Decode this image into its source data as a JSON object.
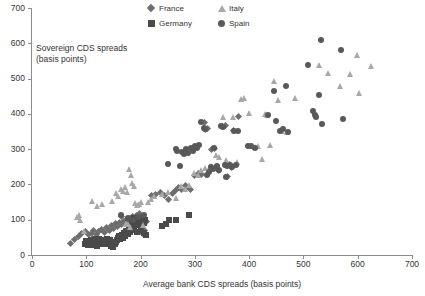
{
  "chart_data": {
    "type": "scatter",
    "title": "",
    "xlabel": "Average bank CDS spreads (basis points)",
    "ylabel": "Sovereign CDS spreads\n(basis points)",
    "annotation": "Sovereign CDS spreads\n(basis points)",
    "xlim": [
      0,
      700
    ],
    "ylim": [
      0,
      700
    ],
    "xticks": [
      0,
      100,
      200,
      300,
      400,
      500,
      600,
      700
    ],
    "yticks": [
      0,
      100,
      200,
      300,
      400,
      500,
      600,
      700
    ],
    "grid": false,
    "legend_position": "top-center",
    "series": [
      {
        "name": "France",
        "marker": "diamond",
        "color": "#6e6e6e",
        "points": [
          [
            70,
            34
          ],
          [
            78,
            45
          ],
          [
            86,
            52
          ],
          [
            92,
            60
          ],
          [
            99,
            66
          ],
          [
            104,
            57
          ],
          [
            110,
            62
          ],
          [
            113,
            70
          ],
          [
            118,
            58
          ],
          [
            122,
            66
          ],
          [
            128,
            72
          ],
          [
            133,
            63
          ],
          [
            137,
            78
          ],
          [
            142,
            70
          ],
          [
            146,
            84
          ],
          [
            150,
            76
          ],
          [
            154,
            88
          ],
          [
            158,
            80
          ],
          [
            161,
            92
          ],
          [
            165,
            86
          ],
          [
            168,
            95
          ],
          [
            171,
            88
          ],
          [
            174,
            100
          ],
          [
            177,
            93
          ],
          [
            180,
            104
          ],
          [
            183,
            97
          ],
          [
            186,
            108
          ],
          [
            189,
            99
          ],
          [
            192,
            112
          ],
          [
            195,
            104
          ],
          [
            198,
            118
          ],
          [
            201,
            109
          ],
          [
            204,
            60
          ],
          [
            207,
            70
          ],
          [
            164,
            110
          ],
          [
            176,
            86
          ],
          [
            188,
            80
          ],
          [
            196,
            66
          ],
          [
            206,
            100
          ],
          [
            210,
            95
          ],
          [
            220,
            168
          ],
          [
            228,
            172
          ],
          [
            236,
            178
          ],
          [
            244,
            168
          ],
          [
            252,
            156
          ],
          [
            258,
            175
          ],
          [
            264,
            182
          ],
          [
            270,
            190
          ],
          [
            276,
            186
          ],
          [
            282,
            196
          ],
          [
            288,
            192
          ],
          [
            292,
            185
          ],
          [
            300,
            225
          ],
          [
            306,
            232
          ],
          [
            312,
            228
          ],
          [
            318,
            375
          ],
          [
            320,
            355
          ],
          [
            324,
            358
          ],
          [
            330,
            300
          ],
          [
            336,
            302
          ],
          [
            340,
            252
          ],
          [
            344,
            240
          ],
          [
            350,
            365
          ],
          [
            356,
            366
          ],
          [
            360,
            222
          ],
          [
            364,
            256
          ],
          [
            368,
            248
          ],
          [
            372,
            352
          ],
          [
            376,
            256
          ],
          [
            380,
            392
          ]
        ]
      },
      {
        "name": "Germany",
        "marker": "square",
        "color": "#4a4a4a",
        "points": [
          [
            98,
            30
          ],
          [
            102,
            34
          ],
          [
            106,
            32
          ],
          [
            110,
            36
          ],
          [
            114,
            30
          ],
          [
            118,
            38
          ],
          [
            122,
            34
          ],
          [
            126,
            40
          ],
          [
            100,
            40
          ],
          [
            104,
            28
          ],
          [
            108,
            42
          ],
          [
            112,
            28
          ],
          [
            116,
            44
          ],
          [
            120,
            26
          ],
          [
            124,
            46
          ],
          [
            128,
            30
          ],
          [
            130,
            36
          ],
          [
            132,
            42
          ],
          [
            134,
            32
          ],
          [
            136,
            38
          ],
          [
            138,
            44
          ],
          [
            140,
            30
          ],
          [
            142,
            36
          ],
          [
            144,
            42
          ],
          [
            146,
            26
          ],
          [
            148,
            32
          ],
          [
            150,
            24
          ],
          [
            152,
            30
          ],
          [
            154,
            36
          ],
          [
            156,
            42
          ],
          [
            158,
            48
          ],
          [
            160,
            54
          ],
          [
            162,
            44
          ],
          [
            164,
            50
          ],
          [
            166,
            56
          ],
          [
            168,
            48
          ],
          [
            170,
            62
          ],
          [
            172,
            54
          ],
          [
            174,
            68
          ],
          [
            176,
            60
          ],
          [
            178,
            74
          ],
          [
            180,
            66
          ],
          [
            182,
            80
          ],
          [
            184,
            72
          ],
          [
            186,
            86
          ],
          [
            188,
            78
          ],
          [
            190,
            92
          ],
          [
            192,
            84
          ],
          [
            194,
            98
          ],
          [
            196,
            90
          ],
          [
            198,
            104
          ],
          [
            200,
            96
          ],
          [
            202,
            86
          ],
          [
            204,
            102
          ],
          [
            206,
            92
          ],
          [
            208,
            100
          ],
          [
            210,
            58
          ],
          [
            176,
            100
          ],
          [
            182,
            96
          ],
          [
            188,
            104
          ],
          [
            194,
            66
          ],
          [
            200,
            72
          ],
          [
            206,
            62
          ],
          [
            240,
            82
          ],
          [
            246,
            88
          ],
          [
            252,
            98
          ],
          [
            266,
            100
          ],
          [
            290,
            114
          ]
        ]
      },
      {
        "name": "Italy",
        "marker": "triangle",
        "color": "#a8a8a8",
        "points": [
          [
            84,
            108
          ],
          [
            88,
            112
          ],
          [
            90,
            100
          ],
          [
            96,
            68
          ],
          [
            112,
            152
          ],
          [
            120,
            140
          ],
          [
            130,
            144
          ],
          [
            148,
            152
          ],
          [
            156,
            176
          ],
          [
            160,
            168
          ],
          [
            164,
            188
          ],
          [
            168,
            182
          ],
          [
            172,
            192
          ],
          [
            176,
            178
          ],
          [
            180,
            244
          ],
          [
            184,
            228
          ],
          [
            186,
            204
          ],
          [
            188,
            196
          ],
          [
            190,
            148
          ],
          [
            194,
            142
          ],
          [
            198,
            144
          ],
          [
            202,
            150
          ],
          [
            206,
            84
          ],
          [
            182,
            80
          ],
          [
            178,
            88
          ],
          [
            174,
            92
          ],
          [
            214,
            150
          ],
          [
            220,
            158
          ],
          [
            226,
            166
          ],
          [
            240,
            172
          ],
          [
            252,
            178
          ],
          [
            266,
            162
          ],
          [
            276,
            196
          ],
          [
            282,
            186
          ],
          [
            290,
            198
          ],
          [
            300,
            232
          ],
          [
            306,
            226
          ],
          [
            312,
            240
          ],
          [
            320,
            246
          ],
          [
            328,
            252
          ],
          [
            340,
            284
          ],
          [
            346,
            278
          ],
          [
            352,
            392
          ],
          [
            358,
            268
          ],
          [
            364,
            258
          ],
          [
            372,
            392
          ],
          [
            378,
            264
          ],
          [
            386,
            442
          ],
          [
            392,
            444
          ],
          [
            400,
            402
          ],
          [
            406,
            310
          ],
          [
            412,
            306
          ],
          [
            418,
            308
          ],
          [
            424,
            272
          ],
          [
            430,
            400
          ],
          [
            434,
            396
          ],
          [
            440,
            312
          ],
          [
            446,
            494
          ],
          [
            454,
            440
          ],
          [
            462,
            352
          ],
          [
            470,
            350
          ],
          [
            486,
            444
          ],
          [
            530,
            538
          ],
          [
            546,
            516
          ],
          [
            568,
            478
          ],
          [
            586,
            514
          ],
          [
            600,
            568
          ],
          [
            604,
            460
          ],
          [
            626,
            536
          ]
        ]
      },
      {
        "name": "Spain",
        "marker": "circle",
        "color": "#595959",
        "points": [
          [
            164,
            112
          ],
          [
            176,
            104
          ],
          [
            186,
            100
          ],
          [
            196,
            108
          ],
          [
            206,
            112
          ],
          [
            250,
            258
          ],
          [
            266,
            300
          ],
          [
            268,
            296
          ],
          [
            272,
            252
          ],
          [
            276,
            292
          ],
          [
            280,
            286
          ],
          [
            284,
            300
          ],
          [
            288,
            288
          ],
          [
            292,
            304
          ],
          [
            296,
            296
          ],
          [
            300,
            308
          ],
          [
            304,
            302
          ],
          [
            308,
            312
          ],
          [
            312,
            376
          ],
          [
            316,
            360
          ],
          [
            318,
            356
          ],
          [
            322,
            226
          ],
          [
            326,
            234
          ],
          [
            330,
            248
          ],
          [
            334,
            244
          ],
          [
            336,
            302
          ],
          [
            340,
            252
          ],
          [
            344,
            240
          ],
          [
            348,
            366
          ],
          [
            352,
            364
          ],
          [
            356,
            256
          ],
          [
            358,
            222
          ],
          [
            360,
            252
          ],
          [
            364,
            256
          ],
          [
            368,
            248
          ],
          [
            372,
            352
          ],
          [
            376,
            256
          ],
          [
            380,
            352
          ],
          [
            398,
            310
          ],
          [
            404,
            308
          ],
          [
            410,
            304
          ],
          [
            434,
            398
          ],
          [
            446,
            466
          ],
          [
            450,
            380
          ],
          [
            456,
            352
          ],
          [
            462,
            356
          ],
          [
            468,
            480
          ],
          [
            472,
            350
          ],
          [
            508,
            538
          ],
          [
            518,
            408
          ],
          [
            522,
            396
          ],
          [
            524,
            392
          ],
          [
            528,
            454
          ],
          [
            532,
            608
          ],
          [
            534,
            372
          ],
          [
            570,
            582
          ],
          [
            572,
            386
          ]
        ]
      }
    ]
  }
}
